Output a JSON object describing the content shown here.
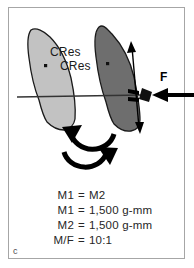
{
  "figure": {
    "panel_letter": "c",
    "background_color": "#ffffff",
    "border_color": "#a6a6a6"
  },
  "labels": {
    "cres_1": "CRes",
    "cres_2": "CRes",
    "force": "F"
  },
  "equations": [
    {
      "lhs": "M1",
      "op": "=",
      "rhs": "M2"
    },
    {
      "lhs": "M1",
      "op": "=",
      "rhs": "1,500 g-mm"
    },
    {
      "lhs": "M2",
      "op": "=",
      "rhs": "1,500 g-mm"
    },
    {
      "lhs": "M/F",
      "op": "=",
      "rhs": "10:1"
    }
  ],
  "colors": {
    "tooth_light": "#c2c2c2",
    "tooth_dark": "#6e6e6e",
    "outline": "#1a1a1a",
    "arrow": "#000000",
    "occlusal_line": "#333333"
  },
  "graphics": {
    "tooth_initial": "tooth-outline-light",
    "tooth_displaced": "tooth-outline-dark",
    "center_of_resistance_initial": "cres-dot-light",
    "center_of_resistance_displaced": "cres-dot-dark",
    "occlusal_plane": "horizontal-reference-line",
    "force_arrow": "horizontal-force-arrow",
    "bracket": "bracket-attachment",
    "couple_arrow": "vertical-double-headed-arrow",
    "rotation_arrow_upper": "curved-arrow-counterclockwise",
    "rotation_arrow_lower": "curved-arrow-clockwise"
  }
}
